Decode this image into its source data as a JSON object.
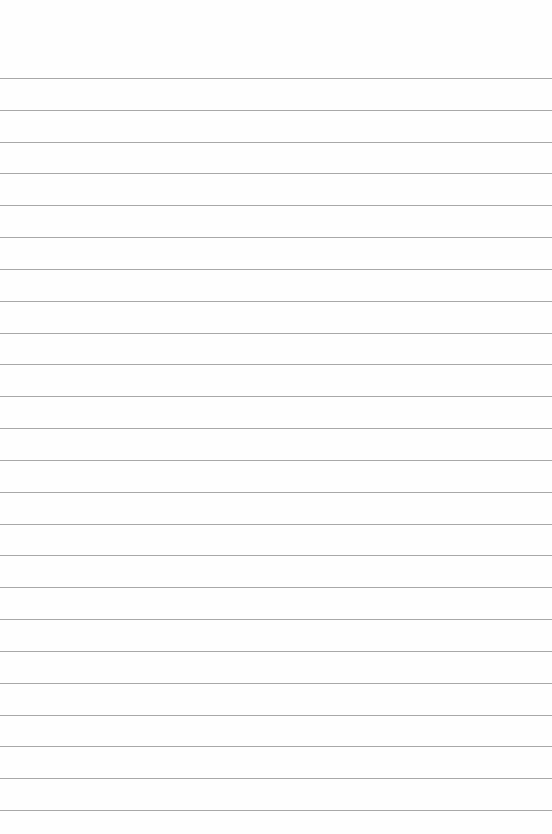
{
  "page": {
    "type": "lined-paper",
    "line_count": 24,
    "line_color": "#a8a8a8",
    "background_color": "#fefefe",
    "text": ""
  }
}
